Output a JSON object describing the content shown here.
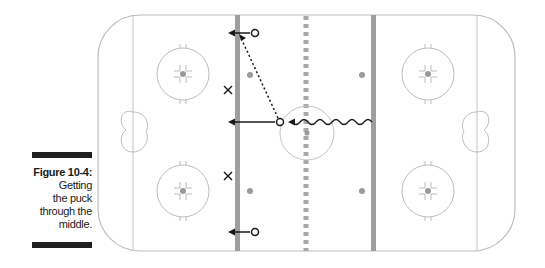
{
  "figure": {
    "label": "Figure 10-4:",
    "caption_lines": [
      "Getting",
      "the puck",
      "through the",
      "middle."
    ]
  },
  "rink": {
    "outline_color": "#bdbdbd",
    "blue_line_color": "#9e9e9e",
    "red_line_color": "#a8a8a8",
    "dot_color": "#9a9a9a",
    "player_color": "#1a1a1a"
  },
  "players": {
    "offense": [
      {
        "symbol": "O",
        "x": 255,
        "y": 33
      },
      {
        "symbol": "O",
        "x": 280,
        "y": 122
      },
      {
        "symbol": "O",
        "x": 255,
        "y": 232
      }
    ],
    "defense": [
      {
        "symbol": "X",
        "x": 228,
        "y": 90
      },
      {
        "symbol": "X",
        "x": 228,
        "y": 176
      }
    ]
  }
}
